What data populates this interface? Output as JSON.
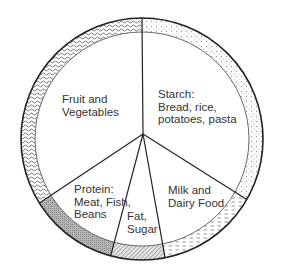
{
  "chart_data": {
    "type": "pie",
    "title": "",
    "style": "outer ring with hatch/dot patterns, white inner wedges, black outlines",
    "start_angle_deg": 0,
    "direction": "clockwise",
    "segments": [
      {
        "name": "Starch: Bread, rice, potatoes, pasta",
        "lines": [
          "Starch:",
          "Bread, rice,",
          "potatoes, pasta"
        ],
        "percent": 33.3,
        "start": 0,
        "end": 120,
        "pattern": "dots",
        "color": "#c8c8c8"
      },
      {
        "name": "Milk and Dairy Food",
        "lines": [
          "Milk and",
          "Dairy Food"
        ],
        "percent": 13.6,
        "start": 120,
        "end": 169,
        "pattern": "dashes",
        "color": "#c0c0c0"
      },
      {
        "name": "Fat, Sugar",
        "lines": [
          "Fat,",
          "Sugar"
        ],
        "percent": 7.2,
        "start": 169,
        "end": 195,
        "pattern": "diagonal-hatch",
        "color": "#8a8a8a"
      },
      {
        "name": "Protein: Meat, Fish, Beans",
        "lines": [
          "Protein:",
          "Meat, Fish,",
          "Beans"
        ],
        "percent": 12.0,
        "start": 195,
        "end": 238,
        "pattern": "dense-crosshatch",
        "color": "#9a9a9a"
      },
      {
        "name": "Fruit and Vegetables",
        "lines": [
          "Fruit and",
          "Vegetables"
        ],
        "percent": 33.9,
        "start": 238,
        "end": 360,
        "pattern": "waves",
        "color": "#9c9c9c"
      }
    ]
  },
  "labels": {
    "fruit": [
      "Fruit and",
      "Vegetables"
    ],
    "starch": [
      "Starch:",
      "Bread, rice,",
      "potatoes, pasta"
    ],
    "milk": [
      "Milk and",
      "Dairy Food"
    ],
    "protein": [
      "Protein:",
      "Meat, Fish,",
      "Beans"
    ],
    "fat": [
      "Fat,",
      "Sugar"
    ]
  }
}
